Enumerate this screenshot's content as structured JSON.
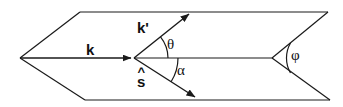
{
  "figure": {
    "type": "vector-geometry-diagram",
    "width": 343,
    "height": 107,
    "background_color": "#ffffff",
    "stroke_color": "#1a1a1a"
  },
  "labels": {
    "incident_wavevector": "k",
    "scattered_wavevector": "k'",
    "unit_vector_base": "s",
    "unit_vector_hat": "^",
    "scattering_angle": "θ",
    "alpha_angle": "α",
    "phi_angle": "φ"
  },
  "vectors": [
    {
      "name": "k",
      "label": "k",
      "from": [
        20,
        58
      ],
      "to": [
        133,
        58
      ],
      "arrowhead": "filled-triangle",
      "description": "incident wavevector, horizontal, pointing right"
    },
    {
      "name": "k-prime",
      "label": "k'",
      "from": [
        134,
        58
      ],
      "to": [
        190,
        13
      ],
      "arrowhead": "filled-triangle",
      "description": "scattered wavevector, pointing up-right"
    },
    {
      "name": "s-hat",
      "label": "s",
      "from": [
        134,
        58
      ],
      "to": [
        196,
        98
      ],
      "arrowhead": "filled-triangle",
      "description": "unit direction vector, pointing down-right"
    }
  ],
  "angles": [
    {
      "name": "theta",
      "label": "θ",
      "vertex": [
        134,
        58
      ],
      "between": [
        "k-axis",
        "k-prime"
      ],
      "arc_radius": 34,
      "label_position": [
        172,
        45
      ]
    },
    {
      "name": "alpha",
      "label": "α",
      "vertex": [
        134,
        58
      ],
      "between": [
        "k-axis",
        "s-hat"
      ],
      "arc_radius": 44,
      "label_position": [
        182,
        71
      ]
    },
    {
      "name": "phi",
      "label": "φ",
      "vertex": [
        272,
        58
      ],
      "between": [
        "upper-right-edge",
        "lower-right-edge"
      ],
      "arc_radius": 30,
      "label_position": [
        296,
        56
      ]
    }
  ],
  "outline": {
    "name": "hexagonal-beam-envelope",
    "points": [
      [
        20,
        58
      ],
      [
        80,
        12
      ],
      [
        328,
        12
      ],
      [
        272,
        58
      ],
      [
        330,
        100
      ],
      [
        85,
        100
      ]
    ],
    "description": "elongated hexagon / flattened parallelogram envelope with left and right apex vertices"
  }
}
